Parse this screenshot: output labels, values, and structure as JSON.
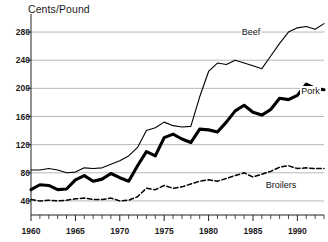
{
  "chart_data": {
    "type": "line",
    "title": "",
    "xlabel": "",
    "ylabel": "Cents/Pound",
    "ylim": [
      20,
      300
    ],
    "xlim": [
      1960,
      1993
    ],
    "grid": "horizontal",
    "legend_position": "inline-at-line-end",
    "ytick_labels": [
      "280",
      "240",
      "200",
      "160",
      "120",
      "80",
      "40"
    ],
    "ytick_values": [
      280,
      240,
      200,
      160,
      120,
      80,
      40
    ],
    "xtick_labels": [
      "1960",
      "1965",
      "1970",
      "1975",
      "1980",
      "1985",
      "1990"
    ],
    "xtick_values": [
      1960,
      1965,
      1970,
      1975,
      1980,
      1985,
      1990
    ],
    "x": [
      1960,
      1961,
      1962,
      1963,
      1964,
      1965,
      1966,
      1967,
      1968,
      1969,
      1970,
      1971,
      1972,
      1973,
      1974,
      1975,
      1976,
      1977,
      1978,
      1979,
      1980,
      1981,
      1982,
      1983,
      1984,
      1985,
      1986,
      1987,
      1988,
      1989,
      1990,
      1991,
      1992,
      1993
    ],
    "series": [
      {
        "name": "Beef",
        "style": "solid-thin",
        "color": "#000000",
        "values": [
          84,
          84,
          86,
          84,
          80,
          81,
          87,
          86,
          87,
          92,
          97,
          104,
          116,
          140,
          144,
          152,
          147,
          145,
          146,
          188,
          224,
          236,
          234,
          240,
          236,
          232,
          228,
          246,
          264,
          280,
          286,
          288,
          284,
          292
        ]
      },
      {
        "name": "Pork",
        "style": "solid-thick",
        "color": "#000000",
        "values": [
          56,
          63,
          62,
          56,
          57,
          70,
          76,
          68,
          71,
          79,
          73,
          68,
          90,
          110,
          104,
          130,
          135,
          128,
          123,
          142,
          141,
          138,
          152,
          168,
          176,
          166,
          162,
          170,
          186,
          184,
          190,
          206,
          200,
          198
        ]
      },
      {
        "name": "Broilers",
        "style": "dashed",
        "color": "#000000",
        "values": [
          42,
          40,
          41,
          40,
          41,
          43,
          44,
          42,
          42,
          44,
          40,
          41,
          46,
          58,
          56,
          62,
          58,
          60,
          64,
          68,
          70,
          68,
          72,
          76,
          80,
          74,
          78,
          82,
          88,
          90,
          86,
          87,
          86,
          86
        ]
      }
    ]
  },
  "labels": {
    "beef": "Beef",
    "pork": "Pork",
    "broilers": "Broilers"
  }
}
